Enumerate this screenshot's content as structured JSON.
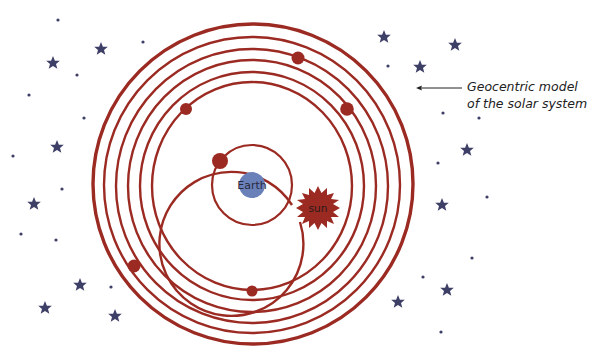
{
  "diagram": {
    "title": "Geocentric model of the solar system",
    "caption_line1": "Geocentric model",
    "caption_line2": "of the solar system",
    "center_label": "Earth",
    "sun_label": "sun",
    "colors": {
      "orbit": "#9b2a22",
      "planet": "#9b2a22",
      "earth": "#6a80b8",
      "star": "#3d3f66",
      "dot": "#3d3f66",
      "text": "#222222"
    },
    "center": [
      252,
      185
    ],
    "orbits_radius": [
      40,
      73,
      100,
      112,
      124,
      136,
      148,
      160
    ],
    "bodies": [
      {
        "name": "moon",
        "x": 220,
        "y": 161,
        "r": 8
      },
      {
        "name": "planet-2",
        "x": 186,
        "y": 109,
        "r": 6
      },
      {
        "name": "planet-3",
        "x": 298,
        "y": 58,
        "r": 6.5
      },
      {
        "name": "planet-4",
        "x": 347,
        "y": 109,
        "r": 6.5
      },
      {
        "name": "planet-5",
        "x": 134,
        "y": 266,
        "r": 6.5
      },
      {
        "name": "planet-6",
        "x": 252,
        "y": 291,
        "r": 5.5
      }
    ],
    "sun": {
      "x": 318,
      "y": 208
    }
  }
}
